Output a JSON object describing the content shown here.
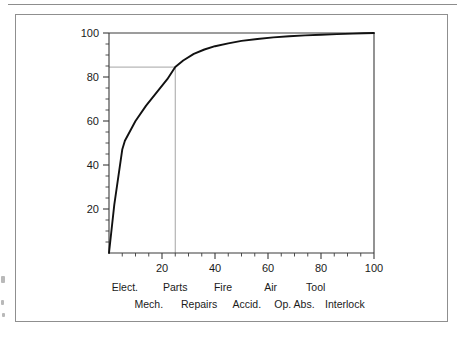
{
  "figure": {
    "background_color": "#ffffff",
    "border_color": "#8f8f8f",
    "curve_color": "#111111",
    "reference_line_color": "#9a9a9a",
    "axis_color": "#3a3a3a"
  },
  "chart_data": {
    "type": "line",
    "title": "",
    "subtitle": "",
    "xlabel": "",
    "ylabel": "",
    "xlim": [
      0,
      100
    ],
    "ylim": [
      0,
      100
    ],
    "grid": false,
    "legend": null,
    "x_ticks": [
      20,
      40,
      60,
      80,
      100
    ],
    "x_tick_labels": [
      "20",
      "40",
      "60",
      "80",
      "100"
    ],
    "x_minor_tick_step": 5,
    "y_ticks": [
      20,
      40,
      60,
      80,
      100
    ],
    "y_tick_labels": [
      "20",
      "40",
      "60",
      "80",
      "100"
    ],
    "y_minor_tick_step": 5,
    "series": [
      {
        "name": "cumulative-percentage",
        "x": [
          0,
          2,
          5,
          6,
          10,
          14,
          18,
          22,
          25,
          28,
          32,
          36,
          40,
          45,
          50,
          56,
          62,
          68,
          74,
          80,
          86,
          92,
          96,
          100
        ],
        "values": [
          0,
          22,
          47,
          51,
          60,
          67,
          73,
          79,
          84.5,
          87.5,
          90.5,
          92.5,
          94,
          95.3,
          96.4,
          97.3,
          98,
          98.5,
          98.9,
          99.2,
          99.5,
          99.7,
          99.9,
          100
        ]
      }
    ],
    "annotations": [
      {
        "name": "reference-lines",
        "type": "crosshair",
        "x": 25,
        "y": 84.5,
        "horizontal_from_x": 0,
        "vertical_from_y": 0
      }
    ],
    "category_labels_row1": [
      {
        "label": "Elect.",
        "x": 6
      },
      {
        "label": "Parts",
        "x": 25
      },
      {
        "label": "Fire",
        "x": 43
      },
      {
        "label": "Air",
        "x": 61
      },
      {
        "label": "Tool",
        "x": 78
      }
    ],
    "category_labels_row2": [
      {
        "label": "Mech.",
        "x": 15
      },
      {
        "label": "Repairs",
        "x": 34
      },
      {
        "label": "Accid.",
        "x": 52
      },
      {
        "label": "Op. Abs.",
        "x": 70
      },
      {
        "label": "Interlock",
        "x": 89
      }
    ]
  }
}
